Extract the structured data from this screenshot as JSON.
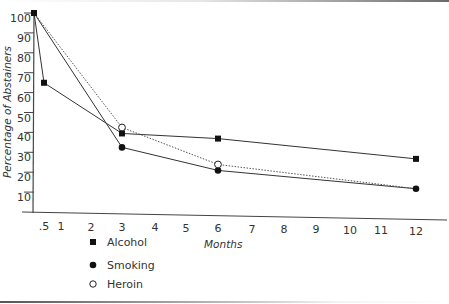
{
  "chart_data": {
    "type": "line",
    "title": "",
    "xlabel": "Months",
    "ylabel": "Percentage of Abstainers",
    "xlim": [
      0,
      12
    ],
    "ylim": [
      0,
      100
    ],
    "x_ticks": [
      ".5",
      "1",
      "2",
      "3",
      "4",
      "5",
      "6",
      "7",
      "8",
      "9",
      "10",
      "11",
      "12"
    ],
    "x_tick_values": [
      0.5,
      1,
      2,
      3,
      4,
      5,
      6,
      7,
      8,
      9,
      10,
      11,
      12
    ],
    "y_ticks": [
      10,
      20,
      30,
      40,
      50,
      60,
      70,
      80,
      90,
      100
    ],
    "grid": false,
    "legend_position": "bottom-left",
    "series": [
      {
        "name": "Alcohol",
        "marker": "filled-square",
        "line_style": "solid",
        "x": [
          0,
          0.5,
          3,
          6,
          12
        ],
        "values": [
          100,
          65,
          40,
          38,
          29
        ]
      },
      {
        "name": "Smoking",
        "marker": "filled-circle",
        "line_style": "solid",
        "x": [
          0,
          3,
          6,
          12
        ],
        "values": [
          100,
          33,
          22,
          14
        ]
      },
      {
        "name": "Heroin",
        "marker": "open-circle",
        "line_style": "dotted",
        "x": [
          0,
          3,
          6,
          12
        ],
        "values": [
          100,
          43,
          25,
          14
        ]
      }
    ]
  },
  "legend": {
    "items": [
      {
        "label": "Alcohol",
        "marker": "filled-square"
      },
      {
        "label": "Smoking",
        "marker": "filled-circle"
      },
      {
        "label": "Heroin",
        "marker": "open-circle"
      }
    ]
  },
  "axes": {
    "x_title": "Months",
    "y_title": "Percentage of Abstainers"
  }
}
